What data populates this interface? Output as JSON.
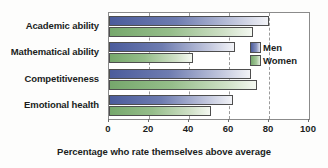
{
  "chart_data": {
    "type": "bar",
    "orientation": "horizontal",
    "title": "",
    "xlabel": "Percentage who rate themselves above average",
    "ylabel": "",
    "xlim": [
      0,
      100
    ],
    "xticks": [
      0,
      20,
      40,
      60,
      80,
      100
    ],
    "grid": true,
    "grid_axis": "x",
    "legend_position": "right-inside",
    "categories": [
      "Academic ability",
      "Mathematical ability",
      "Competitiveness",
      "Emotional health"
    ],
    "series": [
      {
        "name": "Men",
        "color": "#4b5c9c",
        "values": [
          80,
          63,
          71,
          62
        ]
      },
      {
        "name": "Women",
        "color": "#76a86c",
        "values": [
          72,
          42,
          74,
          51
        ]
      }
    ]
  },
  "legend": {
    "items": [
      {
        "label": "Men"
      },
      {
        "label": "Women"
      }
    ]
  },
  "colors": {
    "men": "#4b5c9c",
    "women": "#76a86c",
    "axis": "#8b8b8b",
    "grid": "#9a9a9a",
    "text": "#201d1c",
    "background": "#fdfdfc"
  }
}
